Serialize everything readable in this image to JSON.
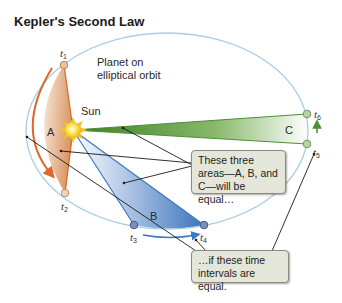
{
  "title": "Kepler's Second Law",
  "labels": {
    "planet_line1": "Planet on",
    "planet_line2": "elliptical orbit",
    "sun": "Sun",
    "area_a": "A",
    "area_b": "B",
    "area_c": "C"
  },
  "time_points": [
    {
      "id": "t1",
      "base": "t",
      "sub": "1"
    },
    {
      "id": "t2",
      "base": "t",
      "sub": "2"
    },
    {
      "id": "t3",
      "base": "t",
      "sub": "3"
    },
    {
      "id": "t4",
      "base": "t",
      "sub": "4"
    },
    {
      "id": "t5",
      "base": "t",
      "sub": "5"
    },
    {
      "id": "t6",
      "base": "t",
      "sub": "6"
    }
  ],
  "callouts": {
    "areas": [
      "These three",
      "areas—A, B, and",
      "C—will be equal…"
    ],
    "intervals": [
      "…if these time",
      "intervals are equal."
    ]
  },
  "colors": {
    "orbit": "#a9cde3",
    "area_a": "#d9793a",
    "area_b": "#3f78bf",
    "area_c": "#5e9a3a",
    "sun": "#f7d21e",
    "callout_bg": "#e3e6d8"
  }
}
